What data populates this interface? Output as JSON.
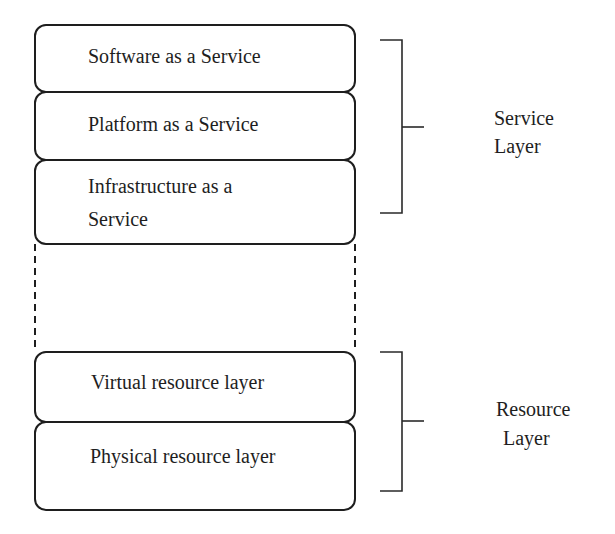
{
  "diagram": {
    "stack": [
      {
        "id": "saas",
        "label": "Software as a Service"
      },
      {
        "id": "paas",
        "label": "Platform as a Service"
      },
      {
        "id": "iaas",
        "line1": "Infrastructure as a",
        "line2": "Service"
      },
      {
        "id": "virtual",
        "label": "Virtual resource layer"
      },
      {
        "id": "physical",
        "label": "Physical resource layer"
      }
    ],
    "groups": [
      {
        "id": "service-layer",
        "line1": "Service",
        "line2": "Layer",
        "spans": [
          "saas",
          "paas",
          "iaas"
        ]
      },
      {
        "id": "resource-layer",
        "line1": "Resource",
        "line2": "Layer",
        "spans": [
          "virtual",
          "physical"
        ]
      }
    ],
    "connector": {
      "style": "dashed",
      "between": [
        "iaas",
        "virtual"
      ]
    },
    "colors": {
      "stroke": "#1e1e1e",
      "background": "#ffffff"
    }
  }
}
